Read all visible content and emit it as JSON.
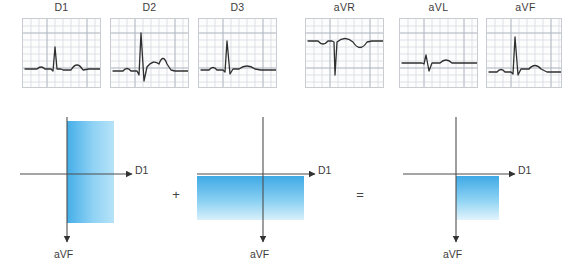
{
  "figure": {
    "title_visible": false,
    "background_color": "#ffffff"
  },
  "ecg_strips": {
    "count": 6,
    "grid_color": "#ccd2d8",
    "grid_major_color": "#b2b9c1",
    "trace_color": "#2f2f2f",
    "panel_border_color": "#c9cdd2",
    "items": [
      {
        "label": "D1",
        "x": 22,
        "width": 79,
        "morphology": "small upright QRS with positive T wave",
        "r_wave_amplitude": 0.55,
        "s_wave_amplitude": 0.05,
        "t_wave_amplitude": 0.22,
        "p_wave_amplitude": 0.07,
        "polarity": "positive"
      },
      {
        "label": "D2",
        "x": 110,
        "width": 79,
        "morphology": "tall upright R wave with deep S and positive T wave",
        "r_wave_amplitude": 1.0,
        "s_wave_amplitude": 0.42,
        "t_wave_amplitude": 0.3,
        "p_wave_amplitude": 0.09,
        "polarity": "positive"
      },
      {
        "label": "D3",
        "x": 198,
        "width": 79,
        "morphology": "upright R wave with small S and low positive T wave",
        "r_wave_amplitude": 0.72,
        "s_wave_amplitude": 0.12,
        "t_wave_amplitude": 0.14,
        "p_wave_amplitude": 0.07,
        "polarity": "positive"
      },
      {
        "label": "aVR",
        "x": 305,
        "width": 79,
        "morphology": "deep negative QS complex with inverted T wave",
        "r_wave_amplitude": 0.08,
        "s_wave_amplitude": 0.95,
        "t_wave_amplitude": -0.3,
        "p_wave_amplitude": -0.08,
        "polarity": "negative"
      },
      {
        "label": "aVL",
        "x": 399,
        "width": 79,
        "morphology": "small biphasic QRS with low positive T wave",
        "r_wave_amplitude": 0.22,
        "s_wave_amplitude": 0.2,
        "t_wave_amplitude": 0.12,
        "p_wave_amplitude": 0.04,
        "polarity": "isoelectric"
      },
      {
        "label": "aVF",
        "x": 486,
        "width": 79,
        "morphology": "tall upright R wave with positive T wave",
        "r_wave_amplitude": 0.88,
        "s_wave_amplitude": 0.1,
        "t_wave_amplitude": 0.2,
        "p_wave_amplitude": 0.08,
        "polarity": "positive"
      }
    ]
  },
  "vector_diagram": {
    "gradient_dark": "#3fa9e5",
    "gradient_light": "#e8f6fd",
    "axis_color": "#4d4d4d",
    "panels": [
      {
        "name": "d1-vector-panel",
        "x_axis_label": "D1",
        "y_axis_label": "aVF",
        "block_orientation": "vertical",
        "block_description": "tall rectangle spanning above and below the horizontal axis, gradient left to right",
        "gradient_direction": "to right",
        "represents": "D1 lead vector magnitude"
      },
      {
        "name": "avf-vector-panel",
        "x_axis_label": "D1",
        "y_axis_label": "aVF",
        "block_orientation": "horizontal",
        "block_description": "wide rectangle below the horizontal axis, gradient top to bottom",
        "gradient_direction": "to bottom",
        "represents": "aVF lead vector magnitude"
      },
      {
        "name": "resultant-vector-panel",
        "x_axis_label": "D1",
        "y_axis_label": "aVF",
        "block_orientation": "square",
        "block_description": "square in lower right quadrant, gradient top to bottom",
        "gradient_direction": "to bottom",
        "represents": "resultant mean electrical axis quadrant"
      }
    ],
    "operators": [
      {
        "symbol": "+",
        "name": "plus-operator"
      },
      {
        "symbol": "=",
        "name": "equals-operator"
      }
    ]
  }
}
